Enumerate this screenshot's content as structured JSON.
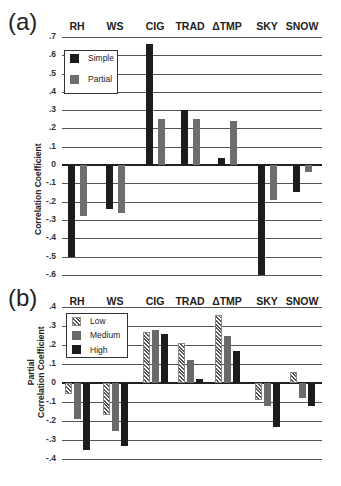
{
  "chart_data": [
    {
      "panel": "(a)",
      "type": "bar",
      "categories": [
        "RH",
        "WS",
        "CIG",
        "TRAD",
        "ΔTMP",
        "SKY",
        "SNOW"
      ],
      "series": [
        {
          "name": "Simple",
          "values": [
            -0.5,
            -0.24,
            0.66,
            0.3,
            0.04,
            -0.6,
            -0.15
          ],
          "color": "#1c1c1c"
        },
        {
          "name": "Partial",
          "values": [
            -0.28,
            -0.26,
            0.25,
            0.25,
            0.24,
            -0.19,
            -0.04
          ],
          "color": "#6e6e6e"
        }
      ],
      "ylabel": "Correlation Coefficient",
      "ylim": [
        -0.6,
        0.7
      ],
      "yticks": [
        ".7",
        ".6",
        ".5",
        ".4",
        ".3",
        ".2",
        ".1",
        "0",
        "-.1",
        "-.2",
        "-.3",
        "-.4",
        "-.5",
        "-.6"
      ],
      "grid": true,
      "legend_position": "upper-left"
    },
    {
      "panel": "(b)",
      "type": "bar",
      "categories": [
        "RH",
        "WS",
        "CIG",
        "TRAD",
        "ΔTMP",
        "SKY",
        "SNOW"
      ],
      "series": [
        {
          "name": "Low",
          "values": [
            -0.06,
            -0.17,
            0.27,
            0.21,
            0.36,
            -0.09,
            0.06
          ],
          "pattern": "hatched"
        },
        {
          "name": "Medium",
          "values": [
            -0.19,
            -0.25,
            0.28,
            0.12,
            0.25,
            -0.12,
            -0.08
          ],
          "color": "#6a6a6a"
        },
        {
          "name": "High",
          "values": [
            -0.35,
            -0.33,
            0.26,
            0.02,
            0.17,
            -0.23,
            -0.12
          ],
          "color": "#1c1c1c"
        }
      ],
      "ylabel": "Partial Correlation Coefficient",
      "ylim": [
        -0.4,
        0.4
      ],
      "yticks": [
        ".4",
        ".3",
        ".2",
        ".1",
        "0",
        "-.1",
        "-.2",
        "-.3",
        "-.4"
      ],
      "grid": true,
      "legend_position": "upper-left"
    }
  ],
  "panels": {
    "a": {
      "label": "(a)",
      "ylabel": "Correlation Coefficient",
      "legend": [
        "Simple",
        "Partial"
      ]
    },
    "b": {
      "label": "(b)",
      "ylabel_line1": "Partial",
      "ylabel_line2": "Correlation Coefficient",
      "legend": [
        "Low",
        "Medium",
        "High"
      ]
    }
  }
}
